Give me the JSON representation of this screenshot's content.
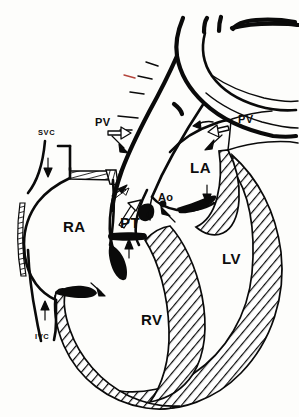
{
  "figure": {
    "type": "anatomical-line-diagram",
    "background_color": "#fdfdfb",
    "ink_color": "#0a0a0a",
    "accent_color": "#b4453c"
  },
  "labels": {
    "svc": "SVC",
    "ivc": "IVC",
    "pv_left": "PV",
    "pv_right": "PV",
    "ra": "RA",
    "rv": "RV",
    "la": "LA",
    "lv": "LV",
    "ao": "Ao",
    "pt": "PT"
  },
  "label_positions": {
    "svc": {
      "x": 38,
      "y": 135
    },
    "ivc": {
      "x": 35,
      "y": 339
    },
    "pv_left": {
      "x": 95,
      "y": 126
    },
    "pv_right": {
      "x": 238,
      "y": 123
    },
    "ra": {
      "x": 63,
      "y": 232
    },
    "rv": {
      "x": 141,
      "y": 325
    },
    "la": {
      "x": 190,
      "y": 173
    },
    "lv": {
      "x": 222,
      "y": 264
    },
    "ao": {
      "x": 158,
      "y": 201
    },
    "pt": {
      "x": 120,
      "y": 228
    }
  },
  "legend": {
    "chamber_names": [
      "RA — right atrium",
      "RV — right ventricle",
      "LA — left atrium",
      "LV — left ventricle"
    ],
    "vessel_names": [
      "SVC — superior vena cava",
      "IVC — inferior vena cava",
      "PV — pulmonary veins",
      "Ao — aorta",
      "PT — pulmonary trunk"
    ]
  },
  "flow_arrows": [
    {
      "name": "svc-inflow",
      "style": "solid",
      "direction": "down"
    },
    {
      "name": "ivc-inflow",
      "style": "solid",
      "direction": "up"
    },
    {
      "name": "ra-to-rv",
      "style": "solid",
      "direction": "down-right"
    },
    {
      "name": "rv-to-pt",
      "style": "solid",
      "direction": "up"
    },
    {
      "name": "pt-outflow",
      "style": "open",
      "direction": "up-left"
    },
    {
      "name": "pt-recirc",
      "style": "open",
      "direction": "up-right"
    },
    {
      "name": "pv-left-inflow",
      "style": "open",
      "direction": "down-right"
    },
    {
      "name": "pv-left-inflow-solid",
      "style": "solid",
      "direction": "down-right"
    },
    {
      "name": "pv-right-inflow",
      "style": "open",
      "direction": "down-left"
    },
    {
      "name": "pv-right-inflow-solid",
      "style": "solid",
      "direction": "down-left"
    },
    {
      "name": "la-to-lv",
      "style": "solid",
      "direction": "down"
    },
    {
      "name": "lv-to-ao",
      "style": "solid",
      "direction": "up-right"
    }
  ]
}
